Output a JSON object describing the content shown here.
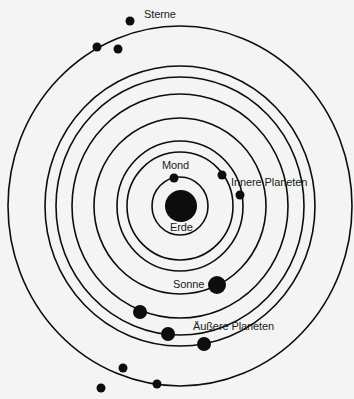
{
  "diagram": {
    "type": "geocentric-model",
    "labels": {
      "stars": "Sterne",
      "moon": "Mond",
      "inner_planets": "Innere Planeten",
      "earth": "Erde",
      "sun": "Sonne",
      "outer_planets": "Äußere Planeten"
    },
    "center": {
      "x": 180,
      "y": 206
    },
    "orbits": [
      {
        "name": "Mond",
        "rx": 28,
        "ry": 29
      },
      {
        "name": "Innere Planet 1",
        "rx": 53,
        "ry": 54
      },
      {
        "name": "Innere Planet 2",
        "rx": 63,
        "ry": 65
      },
      {
        "name": "Sonne",
        "rx": 86,
        "ry": 88
      },
      {
        "name": "Äußere Planet 1",
        "rx": 108,
        "ry": 112
      },
      {
        "name": "Äußere Planet 2",
        "rx": 124,
        "ry": 129
      },
      {
        "name": "Äußere Planet 3",
        "rx": 135,
        "ry": 140
      },
      {
        "name": "Sterne",
        "rx": 172,
        "ry": 180
      }
    ],
    "bodies": [
      {
        "name": "Erde",
        "x": 181,
        "y": 206,
        "r": 16
      },
      {
        "name": "Mond",
        "x": 174,
        "y": 178,
        "r": 4.5
      },
      {
        "name": "Innere Planet 1",
        "x": 222,
        "y": 175,
        "r": 4.5
      },
      {
        "name": "Innere Planet 2",
        "x": 240,
        "y": 195,
        "r": 4.5
      },
      {
        "name": "Sonne",
        "x": 217,
        "y": 285,
        "r": 9
      },
      {
        "name": "Äußere Planet 1",
        "x": 140,
        "y": 312,
        "r": 7
      },
      {
        "name": "Äußere Planet 2",
        "x": 168,
        "y": 334,
        "r": 7
      },
      {
        "name": "Äußere Planet 3",
        "x": 204,
        "y": 344,
        "r": 7
      },
      {
        "name": "Stern 1",
        "x": 130,
        "y": 21,
        "r": 4.5
      },
      {
        "name": "Stern 2",
        "x": 97,
        "y": 47,
        "r": 4.5
      },
      {
        "name": "Stern 3",
        "x": 118,
        "y": 49,
        "r": 4.5
      },
      {
        "name": "Stern 4",
        "x": 123,
        "y": 368,
        "r": 4.5
      },
      {
        "name": "Stern 5",
        "x": 157,
        "y": 384,
        "r": 4.5
      },
      {
        "name": "Stern 6",
        "x": 101,
        "y": 388,
        "r": 4.5
      }
    ],
    "colors": {
      "background": "#f4f4f4",
      "ink": "#0d0d0d"
    }
  }
}
